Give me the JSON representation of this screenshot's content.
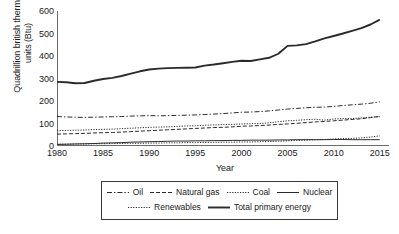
{
  "chart_data": {
    "type": "line",
    "title": "",
    "xlabel": "Year",
    "ylabel": "Quadrillion british thermal\nunits (Btu)",
    "xlim": [
      1980,
      2016
    ],
    "ylim": [
      0,
      600
    ],
    "yticks": [
      0,
      100,
      200,
      300,
      400,
      500,
      600
    ],
    "xticks": [
      1980,
      1985,
      1990,
      1995,
      2000,
      2005,
      2010,
      2015
    ],
    "grid": false,
    "legend_position": "bottom",
    "x": [
      1980,
      1981,
      1982,
      1983,
      1984,
      1985,
      1986,
      1987,
      1988,
      1989,
      1990,
      1991,
      1992,
      1993,
      1994,
      1995,
      1996,
      1997,
      1998,
      1999,
      2000,
      2001,
      2002,
      2003,
      2004,
      2005,
      2006,
      2007,
      2008,
      2009,
      2010,
      2011,
      2012,
      2013,
      2014,
      2015
    ],
    "series": [
      {
        "name": "Total primary energy",
        "style": "solid-thick",
        "color": "#2b2b2b",
        "values": [
          285,
          283,
          279,
          280,
          290,
          298,
          303,
          311,
          322,
          332,
          340,
          344,
          346,
          347,
          348,
          349,
          357,
          362,
          368,
          374,
          379,
          378,
          385,
          392,
          410,
          445,
          447,
          453,
          465,
          478,
          489,
          500,
          512,
          524,
          540,
          562
        ]
      },
      {
        "name": "Oil",
        "style": "dash-dot",
        "color": "#2b2b2b",
        "values": [
          131,
          129,
          128,
          127,
          128,
          129,
          130,
          131,
          133,
          134,
          135,
          134,
          135,
          136,
          137,
          138,
          140,
          142,
          144,
          147,
          150,
          151,
          153,
          156,
          160,
          164,
          167,
          170,
          172,
          173,
          176,
          180,
          183,
          186,
          190,
          196
        ]
      },
      {
        "name": "Natural gas",
        "style": "dash",
        "color": "#2b2b2b",
        "values": [
          53,
          54,
          55,
          56,
          58,
          59,
          60,
          62,
          64,
          66,
          68,
          70,
          72,
          74,
          76,
          78,
          80,
          82,
          83,
          85,
          88,
          89,
          91,
          93,
          96,
          98,
          101,
          104,
          107,
          109,
          112,
          115,
          118,
          121,
          126,
          132
        ]
      },
      {
        "name": "Coal",
        "style": "dot",
        "color": "#2b2b2b",
        "values": [
          68,
          69,
          70,
          71,
          73,
          74,
          75,
          77,
          79,
          81,
          83,
          84,
          85,
          87,
          89,
          90,
          92,
          94,
          95,
          96,
          98,
          99,
          100,
          103,
          108,
          112,
          114,
          117,
          119,
          115,
          120,
          122,
          122,
          125,
          128,
          130
        ]
      },
      {
        "name": "Nuclear",
        "style": "solid",
        "color": "#2b2b2b",
        "values": [
          7,
          8,
          9,
          10,
          11,
          13,
          14,
          15,
          17,
          18,
          19,
          20,
          21,
          22,
          22,
          23,
          23,
          24,
          24,
          25,
          25,
          26,
          26,
          26,
          27,
          27,
          28,
          28,
          28,
          28,
          29,
          29,
          28,
          28,
          28,
          28
        ]
      },
      {
        "name": "Renewables",
        "style": "dot",
        "color": "#2b2b2b",
        "values": [
          8,
          8,
          9,
          9,
          10,
          10,
          11,
          11,
          12,
          12,
          13,
          13,
          14,
          14,
          15,
          15,
          16,
          16,
          17,
          17,
          18,
          18,
          19,
          20,
          21,
          23,
          25,
          26,
          28,
          29,
          31,
          33,
          34,
          36,
          40,
          45
        ]
      }
    ]
  },
  "axes": {
    "ytick_labels": [
      "0",
      "100",
      "200",
      "300",
      "400",
      "500",
      "600"
    ],
    "xtick_labels": [
      "1980",
      "1985",
      "1990",
      "1995",
      "2000",
      "2005",
      "2010",
      "2015"
    ],
    "ylabel": "Quadrillion british thermal\nunits (Btu)",
    "xlabel": "Year"
  },
  "legend": {
    "rows": [
      [
        {
          "label": "Oil",
          "style": "dash-dot"
        },
        {
          "label": "Natural gas",
          "style": "dash"
        },
        {
          "label": "Coal",
          "style": "dot"
        },
        {
          "label": "Nuclear",
          "style": "solid"
        }
      ],
      [
        {
          "label": "Renewables",
          "style": "dot"
        },
        {
          "label": "Total primary energy",
          "style": "solid-thick"
        }
      ]
    ]
  }
}
